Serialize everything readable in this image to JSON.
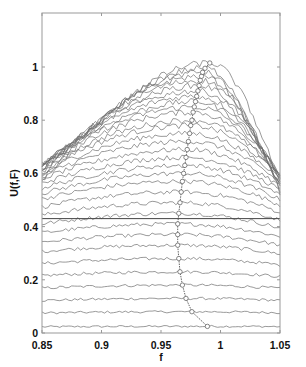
{
  "caption": "",
  "chart_data": {
    "type": "line",
    "title": "",
    "xlabel": "f",
    "ylabel": "U(f,F)",
    "xlim": [
      0.85,
      1.05
    ],
    "ylim": [
      0,
      1.15
    ],
    "xticks": [
      0.85,
      0.9,
      0.95,
      1.0,
      1.05
    ],
    "xtick_labels": [
      "0.85",
      "0.9",
      "0.95",
      "1",
      "1.05"
    ],
    "yticks": [
      0,
      0.2,
      0.4,
      0.6,
      0.8,
      1.0
    ],
    "ytick_labels": [
      "0",
      "0.2",
      "0.4",
      "0.6",
      "0.8",
      "1"
    ],
    "grid": false,
    "legend": null,
    "num_curves": 40,
    "curve_color": "#6f6f6f",
    "horizontal_line": {
      "y": 0.43,
      "color": "#444444"
    },
    "peak_markers": {
      "shape": "circle",
      "points": [
        {
          "f": 0.989,
          "U": 0.025
        },
        {
          "f": 0.976,
          "U": 0.08
        },
        {
          "f": 0.971,
          "U": 0.13
        },
        {
          "f": 0.968,
          "U": 0.18
        },
        {
          "f": 0.966,
          "U": 0.23
        },
        {
          "f": 0.965,
          "U": 0.28
        },
        {
          "f": 0.964,
          "U": 0.33
        },
        {
          "f": 0.964,
          "U": 0.37
        },
        {
          "f": 0.964,
          "U": 0.41
        },
        {
          "f": 0.965,
          "U": 0.45
        },
        {
          "f": 0.966,
          "U": 0.49
        },
        {
          "f": 0.967,
          "U": 0.53
        },
        {
          "f": 0.968,
          "U": 0.57
        },
        {
          "f": 0.969,
          "U": 0.6
        },
        {
          "f": 0.97,
          "U": 0.63
        },
        {
          "f": 0.971,
          "U": 0.66
        },
        {
          "f": 0.972,
          "U": 0.69
        },
        {
          "f": 0.973,
          "U": 0.72
        },
        {
          "f": 0.974,
          "U": 0.75
        },
        {
          "f": 0.975,
          "U": 0.78
        },
        {
          "f": 0.976,
          "U": 0.8
        },
        {
          "f": 0.977,
          "U": 0.83
        },
        {
          "f": 0.978,
          "U": 0.85
        },
        {
          "f": 0.979,
          "U": 0.87
        },
        {
          "f": 0.98,
          "U": 0.89
        },
        {
          "f": 0.981,
          "U": 0.91
        },
        {
          "f": 0.982,
          "U": 0.93
        },
        {
          "f": 0.983,
          "U": 0.95
        },
        {
          "f": 0.984,
          "U": 0.965
        },
        {
          "f": 0.985,
          "U": 0.98
        },
        {
          "f": 0.987,
          "U": 0.995
        },
        {
          "f": 0.991,
          "U": 1.015
        }
      ]
    }
  }
}
